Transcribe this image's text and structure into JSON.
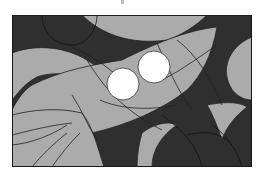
{
  "image": {
    "description": "Abstract stained-glass style grayscale illustration with curved light and dark panels and two white circles",
    "colors": {
      "background": "#ffffff",
      "dark": "#2f2f2f",
      "light": "#ababab",
      "line": "#222222",
      "circle": "#ffffff"
    },
    "circles": [
      {
        "cx": 111,
        "cy": 69,
        "r": 16
      },
      {
        "cx": 142,
        "cy": 52,
        "r": 16
      }
    ]
  }
}
